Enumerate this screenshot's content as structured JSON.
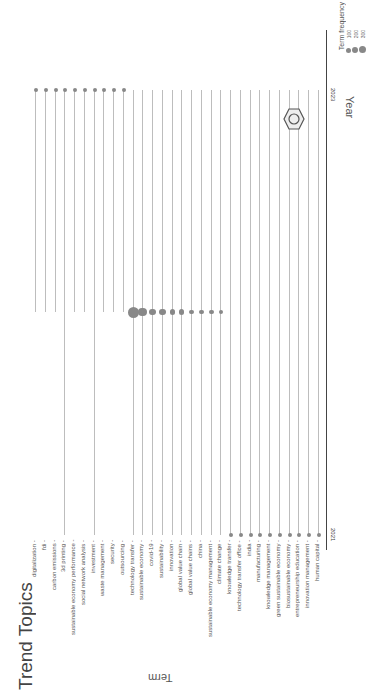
{
  "chart_data": {
    "type": "scatter",
    "title": "Trend Topics",
    "xlabel": "Year",
    "ylabel": "Term",
    "x_ticks": [
      "2021",
      "2023"
    ],
    "legend": {
      "title": "Term frequency",
      "entries": [
        "100",
        "200",
        "300"
      ]
    },
    "orientation_note": "page rotated; terms laid out left-to-right, year axis vertical",
    "terms": [
      {
        "term": "digitalization",
        "start": 2022,
        "median": 2023,
        "end": 2023,
        "freq": 100
      },
      {
        "term": "fdi",
        "start": 2022,
        "median": 2023,
        "end": 2023,
        "freq": 100
      },
      {
        "term": "carbon emissions",
        "start": 2022,
        "median": 2023,
        "end": 2023,
        "freq": 100
      },
      {
        "term": "3d printing",
        "start": 2021,
        "median": 2023,
        "end": 2023,
        "freq": 100
      },
      {
        "term": "sustainable economy performance",
        "start": 2022,
        "median": 2023,
        "end": 2023,
        "freq": 100
      },
      {
        "term": "social network analysis",
        "start": 2022,
        "median": 2023,
        "end": 2023,
        "freq": 100
      },
      {
        "term": "investment",
        "start": 2021,
        "median": 2023,
        "end": 2023,
        "freq": 100
      },
      {
        "term": "waste management",
        "start": 2022,
        "median": 2023,
        "end": 2023,
        "freq": 100
      },
      {
        "term": "security",
        "start": 2022,
        "median": 2023,
        "end": 2023,
        "freq": 100
      },
      {
        "term": "outsourcing",
        "start": 2022,
        "median": 2023,
        "end": 2023,
        "freq": 100
      },
      {
        "term": "technology transfer",
        "start": 2021,
        "median": 2022,
        "end": 2023,
        "freq": 330
      },
      {
        "term": "sustainable economy",
        "start": 2021,
        "median": 2022,
        "end": 2023,
        "freq": 260
      },
      {
        "term": "covid-19",
        "start": 2021,
        "median": 2022,
        "end": 2023,
        "freq": 180
      },
      {
        "term": "sustainability",
        "start": 2021,
        "median": 2022,
        "end": 2023,
        "freq": 170
      },
      {
        "term": "innovation",
        "start": 2021,
        "median": 2022,
        "end": 2023,
        "freq": 160
      },
      {
        "term": "global value chain",
        "start": 2021,
        "median": 2022,
        "end": 2023,
        "freq": 150
      },
      {
        "term": "global value chains",
        "start": 2021,
        "median": 2022,
        "end": 2023,
        "freq": 130
      },
      {
        "term": "china",
        "start": 2021,
        "median": 2022,
        "end": 2023,
        "freq": 120
      },
      {
        "term": "sustainable economy management",
        "start": 2021,
        "median": 2022,
        "end": 2023,
        "freq": 110
      },
      {
        "term": "climate change",
        "start": 2021,
        "median": 2022,
        "end": 2023,
        "freq": 100
      },
      {
        "term": "knowledge transfer",
        "start": 2021,
        "median": 2021,
        "end": 2023,
        "freq": 100
      },
      {
        "term": "technology transfer office",
        "start": 2021,
        "median": 2021,
        "end": 2023,
        "freq": 100
      },
      {
        "term": "india",
        "start": 2021,
        "median": 2021,
        "end": 2023,
        "freq": 100
      },
      {
        "term": "manufacturing",
        "start": 2021,
        "median": 2021,
        "end": 2023,
        "freq": 100
      },
      {
        "term": "knowledge management",
        "start": 2021,
        "median": 2021,
        "end": 2023,
        "freq": 100
      },
      {
        "term": "green sustainable economy",
        "start": 2021,
        "median": 2021,
        "end": 2023,
        "freq": 100
      },
      {
        "term": "biosustainable economy",
        "start": 2021,
        "median": 2021,
        "end": 2023,
        "freq": 100
      },
      {
        "term": "entrepreneurship education",
        "start": 2021,
        "median": 2021,
        "end": 2023,
        "freq": 100
      },
      {
        "term": "innovation management",
        "start": 2021,
        "median": 2021,
        "end": 2023,
        "freq": 100
      },
      {
        "term": "human capital",
        "start": 2021,
        "median": 2021,
        "end": 2023,
        "freq": 100
      }
    ]
  },
  "title": "Trend Topics",
  "axes": {
    "x_title": "Year",
    "y_title": "Term",
    "tick_2021": "2021",
    "tick_2023": "2023"
  },
  "legend": {
    "title": "Term frequency",
    "l100": "100",
    "l200": "200",
    "l300": "300"
  },
  "colors": {
    "dot": "#888888",
    "stem": "#bdbdbd",
    "axis": "#444444"
  }
}
